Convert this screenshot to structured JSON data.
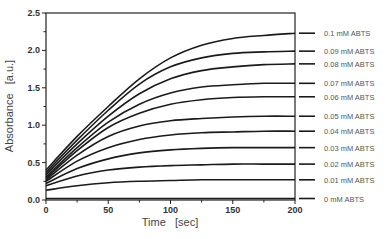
{
  "chart_data": {
    "type": "line",
    "title": "",
    "xlabel": "Time   [sec]",
    "ylabel": "Absorbance   [a.u.]",
    "xlim": [
      0,
      200
    ],
    "ylim": [
      0,
      2.5
    ],
    "xticks": [
      0,
      50,
      100,
      150,
      200
    ],
    "xtick_labels": [
      "0",
      "50",
      "100",
      "150",
      "200"
    ],
    "yticks": [
      0.0,
      0.5,
      1.0,
      1.5,
      2.0,
      2.5
    ],
    "ytick_labels": [
      "0.0",
      "0.5",
      "1.0",
      "1.5",
      "2.0",
      "2.5"
    ],
    "grid": false,
    "legend_position": "right, labels aligned to curve end values",
    "x": [
      0,
      25,
      50,
      75,
      100,
      125,
      150,
      175,
      200
    ],
    "series": [
      {
        "name": "0.1 mM ABTS",
        "values": [
          0.4,
          0.85,
          1.25,
          1.62,
          1.9,
          2.07,
          2.16,
          2.2,
          2.23
        ]
      },
      {
        "name": "0.09 mM ABTS",
        "values": [
          0.37,
          0.8,
          1.2,
          1.55,
          1.78,
          1.9,
          1.96,
          1.98,
          1.99
        ]
      },
      {
        "name": "0.08 mM ABTS",
        "values": [
          0.34,
          0.75,
          1.12,
          1.42,
          1.62,
          1.73,
          1.78,
          1.81,
          1.82
        ]
      },
      {
        "name": "0.07 mM ABTS",
        "values": [
          0.31,
          0.7,
          1.04,
          1.28,
          1.43,
          1.51,
          1.54,
          1.56,
          1.56
        ]
      },
      {
        "name": "0.06 mM ABTS",
        "values": [
          0.29,
          0.66,
          0.97,
          1.16,
          1.28,
          1.34,
          1.37,
          1.38,
          1.38
        ]
      },
      {
        "name": "0.05 mM ABTS",
        "values": [
          0.27,
          0.6,
          0.85,
          0.99,
          1.06,
          1.09,
          1.11,
          1.12,
          1.12
        ]
      },
      {
        "name": "0.04 mM ABTS",
        "values": [
          0.25,
          0.52,
          0.7,
          0.81,
          0.87,
          0.9,
          0.91,
          0.92,
          0.92
        ]
      },
      {
        "name": "0.03 mM ABTS",
        "values": [
          0.22,
          0.42,
          0.55,
          0.63,
          0.67,
          0.69,
          0.7,
          0.7,
          0.7
        ]
      },
      {
        "name": "0.02 mM ABTS",
        "values": [
          0.19,
          0.32,
          0.4,
          0.44,
          0.46,
          0.47,
          0.48,
          0.48,
          0.48
        ]
      },
      {
        "name": "0.01 mM ABTS",
        "values": [
          0.13,
          0.19,
          0.23,
          0.25,
          0.26,
          0.27,
          0.27,
          0.27,
          0.27
        ]
      },
      {
        "name": "0 mM ABTS",
        "values": [
          0.02,
          0.02,
          0.02,
          0.02,
          0.02,
          0.02,
          0.02,
          0.02,
          0.02
        ]
      }
    ],
    "colors": {
      "line": "#1a1a1a",
      "frame": "#222222",
      "label": "#555555"
    }
  }
}
